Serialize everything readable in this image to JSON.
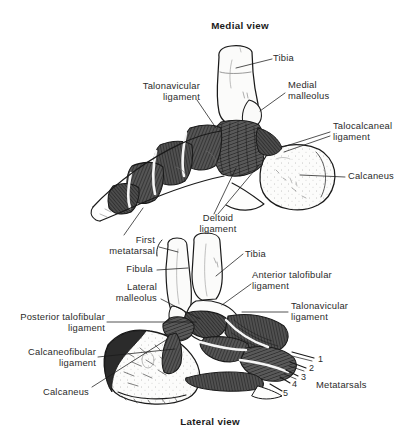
{
  "figure": {
    "background_color": "#ffffff",
    "text_color": "#2b2b2b",
    "ink_color": "#1a1a1a",
    "bone_fill": "#fbfbfa",
    "ligament_fill": "#4a4a4a",
    "ligament_dark": "#2e2e2e",
    "width": 407,
    "height": 440
  },
  "panels": {
    "medial": {
      "title": "Medial view",
      "labels": {
        "tibia": "Tibia",
        "medial_malleolus_line1": "Medial",
        "medial_malleolus_line2": "malleolus",
        "talonavicular_line1": "Talonavicular",
        "talonavicular_line2": "ligament",
        "talocalcaneal_line1": "Talocalcaneal",
        "talocalcaneal_line2": "ligament",
        "calcaneus": "Calcaneus",
        "deltoid_line1": "Deltoid",
        "deltoid_line2": "ligament"
      }
    },
    "lateral": {
      "title": "Lateral view",
      "labels": {
        "first_metatarsal_line1": "First",
        "first_metatarsal_line2": "metatarsal",
        "fibula": "Fibula",
        "tibia": "Tibia",
        "lateral_malleolus_line1": "Lateral",
        "lateral_malleolus_line2": "malleolus",
        "anterior_talofibular_line1": "Anterior talofibular",
        "anterior_talofibular_line2": "ligament",
        "talonavicular_line1": "Talonavicular",
        "talonavicular_line2": "ligament",
        "posterior_talofibular_line1": "Posterior talofibular",
        "posterior_talofibular_line2": "ligament",
        "calcaneofibular_line1": "Calcaneofibular",
        "calcaneofibular_line2": "ligament",
        "calcaneus": "Calcaneus",
        "metatarsals": "Metatarsals"
      },
      "metatarsal_numbers": [
        "1",
        "2",
        "3",
        "4",
        "5"
      ]
    }
  }
}
